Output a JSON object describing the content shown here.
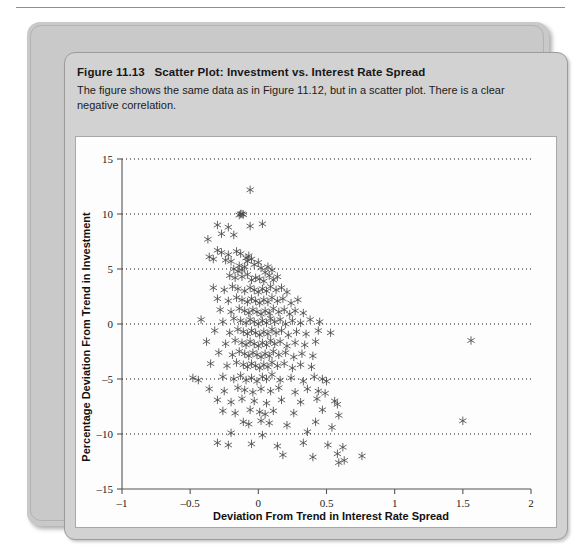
{
  "figure": {
    "number": "Figure 11.13",
    "title": "Scatter Plot: Investment vs. Interest Rate Spread",
    "caption": "The figure shows the same data as in Figure 11.12, but in a scatter plot. There is a clear negative correlation."
  },
  "colors": {
    "plate": "#c9c9c9",
    "panel": "#d2d2d2",
    "canvas": "#fdfdfd",
    "axis": "#555555",
    "grid": "#111111",
    "marker": "#4a4a4a"
  },
  "chart_data": {
    "type": "scatter",
    "title": "Scatter Plot: Investment vs. Interest Rate Spread",
    "xlabel": "Deviation From Trend in Interest Rate Spread",
    "ylabel": "Percentage Deviation From Trend in Investment",
    "xlim": [
      -1,
      2
    ],
    "ylim": [
      -15,
      15
    ],
    "xticks": [
      -1,
      -0.5,
      0,
      0.5,
      1,
      1.5,
      2
    ],
    "xticklabels": [
      "–1",
      "–0.5",
      "0",
      "0.5",
      "1",
      "1.5",
      "2"
    ],
    "yticks": [
      -15,
      -10,
      -5,
      0,
      5,
      10,
      15
    ],
    "yticklabels": [
      "–15",
      "–10",
      "–5",
      "0",
      "5",
      "10",
      "15"
    ],
    "grid": "horizontal-dotted",
    "legend": null,
    "marker": "asterisk",
    "marker_size": 4.2,
    "n_points": 234,
    "points": [
      [
        -0.06,
        12.2
      ],
      [
        -0.13,
        10.0
      ],
      [
        -0.12,
        10.0
      ],
      [
        -0.11,
        9.95
      ],
      [
        -0.14,
        9.9
      ],
      [
        -0.3,
        9.0
      ],
      [
        -0.22,
        8.8
      ],
      [
        -0.06,
        8.9
      ],
      [
        0.03,
        9.1
      ],
      [
        -0.27,
        8.2
      ],
      [
        -0.18,
        8.1
      ],
      [
        -0.37,
        7.7
      ],
      [
        -0.3,
        6.7
      ],
      [
        -0.27,
        6.5
      ],
      [
        -0.22,
        6.3
      ],
      [
        -0.16,
        6.6
      ],
      [
        -0.13,
        6.4
      ],
      [
        -0.36,
        6.1
      ],
      [
        -0.33,
        5.9
      ],
      [
        -0.24,
        5.8
      ],
      [
        -0.2,
        5.7
      ],
      [
        -0.09,
        6.0
      ],
      [
        -0.07,
        6.2
      ],
      [
        -0.08,
        5.7
      ],
      [
        -0.05,
        5.9
      ],
      [
        -0.14,
        5.3
      ],
      [
        -0.1,
        5.2
      ],
      [
        -0.03,
        5.4
      ],
      [
        0.0,
        5.6
      ],
      [
        -0.18,
        5.0
      ],
      [
        -0.15,
        4.8
      ],
      [
        -0.12,
        4.9
      ],
      [
        0.02,
        5.1
      ],
      [
        0.05,
        4.7
      ],
      [
        0.07,
        5.2
      ],
      [
        0.1,
        4.9
      ],
      [
        -0.21,
        4.4
      ],
      [
        -0.17,
        4.2
      ],
      [
        -0.12,
        4.3
      ],
      [
        -0.08,
        4.5
      ],
      [
        -0.05,
        4.0
      ],
      [
        -0.02,
        4.2
      ],
      [
        0.01,
        4.1
      ],
      [
        0.04,
        3.9
      ],
      [
        0.08,
        4.4
      ],
      [
        0.11,
        4.0
      ],
      [
        0.14,
        4.3
      ],
      [
        -0.33,
        3.3
      ],
      [
        -0.25,
        3.1
      ],
      [
        -0.19,
        3.4
      ],
      [
        -0.15,
        3.2
      ],
      [
        -0.1,
        3.0
      ],
      [
        -0.06,
        3.3
      ],
      [
        -0.03,
        3.1
      ],
      [
        0.0,
        2.9
      ],
      [
        0.03,
        3.2
      ],
      [
        0.06,
        3.0
      ],
      [
        0.09,
        3.4
      ],
      [
        0.13,
        3.1
      ],
      [
        0.17,
        3.3
      ],
      [
        0.21,
        2.9
      ],
      [
        -0.3,
        2.3
      ],
      [
        -0.22,
        2.1
      ],
      [
        -0.16,
        2.4
      ],
      [
        -0.12,
        2.2
      ],
      [
        -0.08,
        2.0
      ],
      [
        -0.05,
        2.3
      ],
      [
        -0.02,
        2.1
      ],
      [
        0.01,
        1.9
      ],
      [
        0.04,
        2.2
      ],
      [
        0.07,
        2.0
      ],
      [
        0.1,
        2.4
      ],
      [
        0.14,
        2.1
      ],
      [
        0.18,
        2.3
      ],
      [
        0.24,
        1.9
      ],
      [
        0.29,
        2.2
      ],
      [
        -0.28,
        1.3
      ],
      [
        -0.2,
        1.1
      ],
      [
        -0.14,
        1.4
      ],
      [
        -0.1,
        1.2
      ],
      [
        -0.07,
        1.0
      ],
      [
        -0.04,
        1.3
      ],
      [
        -0.01,
        1.1
      ],
      [
        0.02,
        0.9
      ],
      [
        0.05,
        1.2
      ],
      [
        0.08,
        1.0
      ],
      [
        0.11,
        1.4
      ],
      [
        0.15,
        1.1
      ],
      [
        0.19,
        1.3
      ],
      [
        0.23,
        0.9
      ],
      [
        0.27,
        1.2
      ],
      [
        0.33,
        1.0
      ],
      [
        -0.42,
        0.4
      ],
      [
        -0.26,
        0.2
      ],
      [
        -0.18,
        0.5
      ],
      [
        -0.13,
        0.3
      ],
      [
        -0.09,
        0.1
      ],
      [
        -0.06,
        0.4
      ],
      [
        -0.03,
        0.2
      ],
      [
        0.0,
        0.0
      ],
      [
        0.03,
        0.3
      ],
      [
        0.06,
        0.1
      ],
      [
        0.09,
        0.5
      ],
      [
        0.12,
        0.2
      ],
      [
        0.16,
        0.4
      ],
      [
        0.2,
        0.0
      ],
      [
        0.25,
        0.3
      ],
      [
        0.31,
        0.1
      ],
      [
        0.38,
        0.4
      ],
      [
        0.45,
        0.2
      ],
      [
        -0.32,
        -0.6
      ],
      [
        -0.21,
        -0.8
      ],
      [
        -0.15,
        -0.5
      ],
      [
        -0.11,
        -0.7
      ],
      [
        -0.08,
        -0.9
      ],
      [
        -0.05,
        -0.6
      ],
      [
        -0.02,
        -0.8
      ],
      [
        0.01,
        -1.0
      ],
      [
        0.04,
        -0.7
      ],
      [
        0.07,
        -0.9
      ],
      [
        0.1,
        -0.5
      ],
      [
        0.13,
        -0.8
      ],
      [
        0.17,
        -0.6
      ],
      [
        0.22,
        -1.0
      ],
      [
        0.28,
        -0.7
      ],
      [
        0.35,
        -0.9
      ],
      [
        0.44,
        -0.6
      ],
      [
        0.53,
        -0.8
      ],
      [
        1.56,
        -1.5
      ],
      [
        -0.38,
        -1.6
      ],
      [
        -0.24,
        -1.8
      ],
      [
        -0.17,
        -1.5
      ],
      [
        -0.12,
        -1.7
      ],
      [
        -0.09,
        -1.9
      ],
      [
        -0.06,
        -1.6
      ],
      [
        -0.03,
        -1.8
      ],
      [
        0.0,
        -2.0
      ],
      [
        0.03,
        -1.7
      ],
      [
        0.06,
        -1.9
      ],
      [
        0.09,
        -1.5
      ],
      [
        0.12,
        -1.8
      ],
      [
        0.16,
        -1.6
      ],
      [
        0.21,
        -2.0
      ],
      [
        0.27,
        -1.7
      ],
      [
        0.34,
        -1.9
      ],
      [
        0.42,
        -1.6
      ],
      [
        -0.29,
        -2.6
      ],
      [
        -0.19,
        -2.8
      ],
      [
        -0.14,
        -2.5
      ],
      [
        -0.1,
        -2.7
      ],
      [
        -0.07,
        -2.9
      ],
      [
        -0.04,
        -2.6
      ],
      [
        -0.01,
        -2.8
      ],
      [
        0.02,
        -3.0
      ],
      [
        0.05,
        -2.7
      ],
      [
        0.08,
        -2.9
      ],
      [
        0.11,
        -2.5
      ],
      [
        0.15,
        -2.8
      ],
      [
        0.2,
        -2.6
      ],
      [
        0.26,
        -3.0
      ],
      [
        0.32,
        -2.7
      ],
      [
        0.4,
        -2.9
      ],
      [
        -0.35,
        -3.6
      ],
      [
        -0.23,
        -3.8
      ],
      [
        -0.16,
        -3.5
      ],
      [
        -0.11,
        -3.7
      ],
      [
        -0.08,
        -3.9
      ],
      [
        -0.05,
        -3.6
      ],
      [
        -0.02,
        -3.8
      ],
      [
        0.01,
        -4.0
      ],
      [
        0.04,
        -3.7
      ],
      [
        0.07,
        -3.9
      ],
      [
        0.1,
        -3.5
      ],
      [
        0.14,
        -3.8
      ],
      [
        0.19,
        -3.6
      ],
      [
        0.25,
        -4.0
      ],
      [
        0.31,
        -3.7
      ],
      [
        0.39,
        -3.9
      ],
      [
        -0.48,
        -4.9
      ],
      [
        -0.44,
        -5.1
      ],
      [
        -0.26,
        -4.8
      ],
      [
        -0.18,
        -5.0
      ],
      [
        -0.13,
        -4.7
      ],
      [
        -0.09,
        -5.1
      ],
      [
        -0.05,
        -4.9
      ],
      [
        -0.01,
        -5.2
      ],
      [
        0.03,
        -4.8
      ],
      [
        0.06,
        -5.0
      ],
      [
        0.1,
        -4.6
      ],
      [
        0.16,
        -5.1
      ],
      [
        0.24,
        -4.9
      ],
      [
        0.33,
        -5.2
      ],
      [
        0.41,
        -4.8
      ],
      [
        0.47,
        -5.0
      ],
      [
        0.5,
        -5.2
      ],
      [
        -0.36,
        -5.9
      ],
      [
        -0.25,
        -6.1
      ],
      [
        -0.15,
        -5.8
      ],
      [
        -0.1,
        -6.0
      ],
      [
        -0.04,
        -6.2
      ],
      [
        0.02,
        -5.9
      ],
      [
        0.09,
        -6.1
      ],
      [
        0.15,
        -5.8
      ],
      [
        0.27,
        -6.2
      ],
      [
        0.36,
        -5.9
      ],
      [
        0.44,
        -6.1
      ],
      [
        0.49,
        -6.3
      ],
      [
        -0.3,
        -6.9
      ],
      [
        -0.2,
        -7.1
      ],
      [
        -0.12,
        -6.8
      ],
      [
        -0.03,
        -7.0
      ],
      [
        0.06,
        -7.2
      ],
      [
        0.17,
        -6.9
      ],
      [
        0.31,
        -7.1
      ],
      [
        0.43,
        -6.8
      ],
      [
        0.56,
        -7.0
      ],
      [
        0.58,
        -7.3
      ],
      [
        -0.26,
        -7.9
      ],
      [
        -0.17,
        -8.1
      ],
      [
        -0.06,
        -7.8
      ],
      [
        0.01,
        -8.0
      ],
      [
        0.05,
        -8.2
      ],
      [
        0.11,
        -7.9
      ],
      [
        0.26,
        -8.1
      ],
      [
        0.47,
        -7.8
      ],
      [
        0.59,
        -8.3
      ],
      [
        1.5,
        -8.8
      ],
      [
        -0.11,
        -8.9
      ],
      [
        -0.07,
        -9.1
      ],
      [
        0.02,
        -8.8
      ],
      [
        0.08,
        -9.0
      ],
      [
        0.21,
        -9.2
      ],
      [
        0.42,
        -8.9
      ],
      [
        0.54,
        -9.4
      ],
      [
        -0.2,
        -9.9
      ],
      [
        0.03,
        -10.1
      ],
      [
        0.36,
        -9.8
      ],
      [
        -0.3,
        -10.8
      ],
      [
        -0.22,
        -11.0
      ],
      [
        -0.05,
        -10.9
      ],
      [
        0.14,
        -11.1
      ],
      [
        0.33,
        -10.8
      ],
      [
        0.51,
        -11.0
      ],
      [
        0.62,
        -11.2
      ],
      [
        0.18,
        -11.9
      ],
      [
        0.4,
        -12.1
      ],
      [
        0.58,
        -11.8
      ],
      [
        0.76,
        -12.0
      ],
      [
        0.59,
        -12.6
      ],
      [
        0.63,
        -12.4
      ]
    ]
  }
}
